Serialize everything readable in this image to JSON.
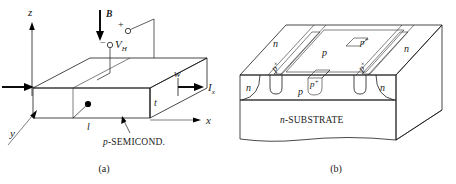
{
  "figure": {
    "title_implicit": "Hall effect device and its integrated realization",
    "captions": {
      "a": "(a)",
      "b": "(b)"
    }
  },
  "fig_a": {
    "name": "hall-effect-bar",
    "axes": {
      "z": "z",
      "x": "x",
      "y": "y"
    },
    "field": {
      "symbol": "B",
      "direction": "down"
    },
    "hall_voltage": {
      "symbol": "V",
      "subscript": "H",
      "plus": "+",
      "minus": "−"
    },
    "current": {
      "symbol": "I",
      "subscript": "x"
    },
    "dimensions": {
      "width": "w",
      "thickness": "t",
      "length": "l"
    },
    "material_label": "p-SEMICOND.",
    "material_prefix": "p",
    "material_rest": "-SEMICOND."
  },
  "fig_b": {
    "name": "integrated-hall-cross-section",
    "substrate": {
      "prefix": "n",
      "rest": "-SUBSTRATE"
    },
    "regions": [
      {
        "id": "n-left-top",
        "label": "n"
      },
      {
        "id": "n-right-top",
        "label": "n"
      },
      {
        "id": "n-left-front",
        "label": "n"
      },
      {
        "id": "n-right-front",
        "label": "n"
      },
      {
        "id": "p-top",
        "label": "p"
      },
      {
        "id": "p-front",
        "label": "p"
      }
    ],
    "contacts": [
      {
        "id": "p-plus-top",
        "base": "p",
        "sup": "+"
      },
      {
        "id": "p-plus-left-strip",
        "base": "p",
        "sup": "+"
      },
      {
        "id": "p-plus-right-strip",
        "base": "p",
        "sup": "+"
      },
      {
        "id": "p-plus-center-tub",
        "base": "p",
        "sup": "+"
      }
    ]
  },
  "colors": {
    "ink": "#1a1a1a",
    "paper": "#ffffff",
    "heavy_arrow": "#000000"
  }
}
